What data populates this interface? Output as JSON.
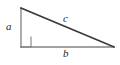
{
  "figure": {
    "name": "right-triangle",
    "background_color": "#ffffff",
    "labels": {
      "leg_vertical": "a",
      "leg_horizontal": "b",
      "hypotenuse": "c"
    },
    "geometry": {
      "apex": {
        "x": 21,
        "y": 8
      },
      "right_angle_vertex": {
        "x": 21,
        "y": 47
      },
      "right_vertex": {
        "x": 114,
        "y": 47
      },
      "right_angle_marker": {
        "x": 21,
        "y": 37,
        "size": 10
      }
    },
    "colors": {
      "hypotenuse_stroke": "#3b3a3c",
      "leg_stroke": "#808285",
      "marker_stroke": "#808285",
      "label_text": "#231f20"
    }
  }
}
